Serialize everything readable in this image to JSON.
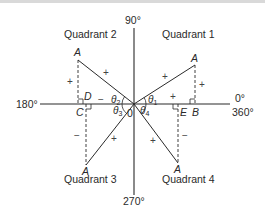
{
  "diagram": {
    "title": "",
    "axes": {
      "top": "90°",
      "left": "180°",
      "right_top": "0°",
      "right_bottom": "360°",
      "bottom": "270°",
      "origin": "0"
    },
    "quadrants": [
      {
        "label": "Quadrant 1",
        "vertex": "A",
        "foot": "B",
        "angle": "θ",
        "angle_sub": "1",
        "hyp_sign": "+",
        "opp_sign": "+",
        "adj_sign": "+"
      },
      {
        "label": "Quadrant 2",
        "vertex": "A",
        "foot": "D",
        "angle": "θ",
        "angle_sub": "2",
        "hyp_sign": "+",
        "opp_sign": "+",
        "adj_sign": "−"
      },
      {
        "label": "Quadrant 3",
        "vertex": "A",
        "foot": "C",
        "angle": "θ",
        "angle_sub": "3",
        "hyp_sign": "+",
        "opp_sign": "−",
        "adj_sign": "−"
      },
      {
        "label": "Quadrant 4",
        "vertex": "A",
        "foot": "E",
        "angle": "θ",
        "angle_sub": "4",
        "hyp_sign": "+",
        "opp_sign": "−",
        "adj_sign": "+"
      }
    ],
    "colors": {
      "line": "#2a2a2a",
      "text": "#2a2a2a",
      "background": "#ffffff"
    }
  }
}
